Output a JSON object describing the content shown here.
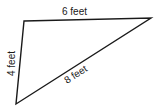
{
  "diagram": {
    "shape": "triangle",
    "stroke_color": "#1a1a1a",
    "vertices": {
      "top_left": [
        24,
        21
      ],
      "top_right": [
        151,
        18
      ],
      "bottom_left": [
        16,
        104
      ]
    },
    "sides": {
      "top": {
        "label": "6 feet"
      },
      "left": {
        "label": "4 feet"
      },
      "hypotenuse": {
        "label": "8 feet"
      }
    }
  }
}
